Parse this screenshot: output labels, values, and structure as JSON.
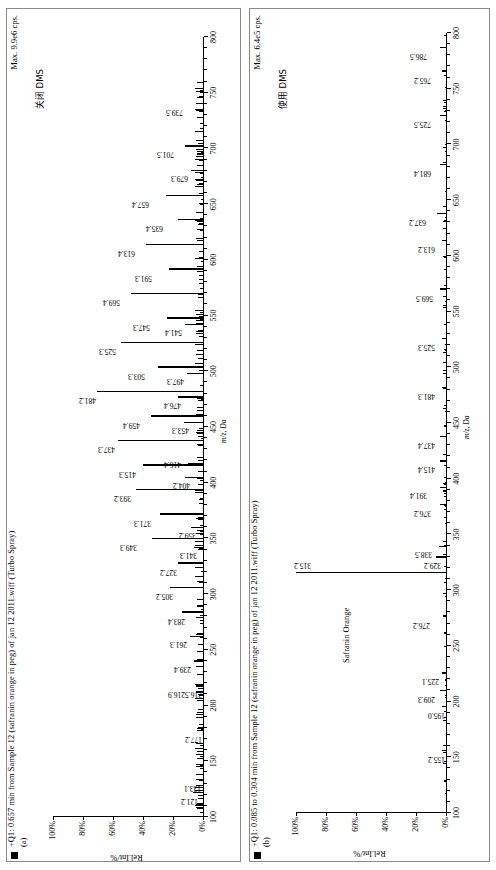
{
  "figure": {
    "domain": "mass-spectrum",
    "panels": [
      {
        "tag": "(a)",
        "title": "+Q1: 0.657 min from Sample 12 (safranin orange in peg) of jan 12 2011.wiff (Turbo Spray)",
        "max_label": "Max. 9.9e6 cps.",
        "condition_label": "关闭 DMS",
        "annotation": "",
        "ylabel": "Rel.Int/%",
        "xlabel": "m/z, Da",
        "ytick_labels": [
          "100%",
          "80%",
          "60%",
          "40%",
          "20%",
          "0%"
        ],
        "ytick_values": [
          100,
          80,
          60,
          40,
          20,
          0
        ],
        "xtick_labels": [
          "100",
          "150",
          "200",
          "250",
          "300",
          "350",
          "400",
          "450",
          "500",
          "550",
          "600",
          "650",
          "700",
          "750",
          "800"
        ],
        "xtick_values": [
          100,
          150,
          200,
          250,
          300,
          350,
          400,
          450,
          500,
          550,
          600,
          650,
          700,
          750,
          800
        ]
      },
      {
        "tag": "(b)",
        "title": "+Q1: 0.085 to 0.304 min from Sample 12 (safranin orange in peg) of jan 12 2011.wiff (Turbo Spray)",
        "max_label": "Max. 6.4e5 cps.",
        "condition_label": "使用 DMS",
        "annotation": "Safranin Orange",
        "ylabel": "Rel.Int/%",
        "xlabel": "m/z, Da",
        "ytick_labels": [
          "100%",
          "80%",
          "60%",
          "40%",
          "20%",
          "0%"
        ],
        "ytick_values": [
          100,
          80,
          60,
          40,
          20,
          0
        ],
        "xtick_labels": [
          "100",
          "150",
          "200",
          "250",
          "300",
          "350",
          "400",
          "450",
          "500",
          "550",
          "600",
          "650",
          "700",
          "750",
          "800"
        ],
        "xtick_values": [
          100,
          150,
          200,
          250,
          300,
          350,
          400,
          450,
          500,
          550,
          600,
          650,
          700,
          750,
          800
        ]
      }
    ]
  },
  "chart_data": [
    {
      "type": "line",
      "subtype": "mass-spectrum-stick",
      "title": "+Q1: 0.657 min from Sample 12 (safranin orange in peg) of jan 12 2011.wiff (Turbo Spray)",
      "panel": "(a)",
      "note": "关闭 DMS / Max. 9.9e6 cps.",
      "xlabel": "m/z, Da",
      "ylabel": "Rel.Int/%",
      "xlim": [
        100,
        800
      ],
      "ylim": [
        0,
        100
      ],
      "grid": false,
      "legend": "none",
      "x": [
        121.2,
        133.1,
        177.2,
        195.1,
        216.5,
        216.9,
        239.4,
        261.3,
        283.4,
        305.2,
        327.2,
        341.3,
        349.3,
        359.2,
        371.3,
        393.2,
        404.2,
        415.3,
        416.4,
        437.3,
        453.3,
        459.4,
        476.4,
        481.2,
        497.3,
        503.3,
        525.3,
        541.4,
        547.3,
        569.4,
        591.3,
        613.4,
        613.4,
        635.4,
        657.4,
        679.3,
        701.5,
        739.5
      ],
      "y": [
        7,
        5,
        4,
        4,
        3,
        5,
        6,
        9,
        14,
        22,
        17,
        6,
        34,
        8,
        29,
        45,
        12,
        40,
        10,
        57,
        13,
        35,
        17,
        71,
        11,
        30,
        55,
        12,
        24,
        48,
        23,
        38,
        38,
        17,
        25,
        8,
        12,
        5
      ],
      "labeled_peaks": [
        {
          "mz": "121.2",
          "rel_int": 7
        },
        {
          "mz": "133.1",
          "rel_int": 5
        },
        {
          "mz": "177.2",
          "rel_int": 4
        },
        {
          "mz": "216.5",
          "rel_int": 3
        },
        {
          "mz": "216.9",
          "rel_int": 5
        },
        {
          "mz": "239.4",
          "rel_int": 6
        },
        {
          "mz": "261.3",
          "rel_int": 9
        },
        {
          "mz": "283.4",
          "rel_int": 14
        },
        {
          "mz": "305.2",
          "rel_int": 22
        },
        {
          "mz": "327.2",
          "rel_int": 17
        },
        {
          "mz": "341.3",
          "rel_int": 6
        },
        {
          "mz": "349.3",
          "rel_int": 34
        },
        {
          "mz": "359.2",
          "rel_int": 8
        },
        {
          "mz": "371.3",
          "rel_int": 29
        },
        {
          "mz": "393.2",
          "rel_int": 45
        },
        {
          "mz": "404.2",
          "rel_int": 12
        },
        {
          "mz": "415.3",
          "rel_int": 40
        },
        {
          "mz": "416.4",
          "rel_int": 10
        },
        {
          "mz": "437.3",
          "rel_int": 57
        },
        {
          "mz": "453.3",
          "rel_int": 13
        },
        {
          "mz": "459.4",
          "rel_int": 35
        },
        {
          "mz": "476.4",
          "rel_int": 17
        },
        {
          "mz": "481.2",
          "rel_int": 71
        },
        {
          "mz": "497.3",
          "rel_int": 11
        },
        {
          "mz": "503.3",
          "rel_int": 30
        },
        {
          "mz": "525.3",
          "rel_int": 55
        },
        {
          "mz": "541.4",
          "rel_int": 12
        },
        {
          "mz": "547.3",
          "rel_int": 24
        },
        {
          "mz": "569.4",
          "rel_int": 48
        },
        {
          "mz": "591.3",
          "rel_int": 23
        },
        {
          "mz": "613.4",
          "rel_int": 38
        },
        {
          "mz": "635.4",
          "rel_int": 17
        },
        {
          "mz": "657.4",
          "rel_int": 25
        },
        {
          "mz": "679.3",
          "rel_int": 8
        },
        {
          "mz": "701.5",
          "rel_int": 12
        },
        {
          "mz": "739.5",
          "rel_int": 5
        }
      ]
    },
    {
      "type": "line",
      "subtype": "mass-spectrum-stick",
      "title": "+Q1: 0.085 to 0.304 min from Sample 12 (safranin orange in peg) of jan 12 2011.wiff (Turbo Spray)",
      "panel": "(b)",
      "note": "使用 DMS / Max. 6.4e5 cps.",
      "xlabel": "m/z, Da",
      "ylabel": "Rel.Int/%",
      "xlim": [
        100,
        800
      ],
      "ylim": [
        0,
        100
      ],
      "grid": false,
      "legend": "none",
      "annotation": "Safranin Orange",
      "x": [
        155.2,
        195.0,
        209.3,
        225.1,
        276.2,
        315.2,
        329.2,
        338.5,
        376.2,
        391.4,
        415.4,
        437.4,
        481.3,
        525.3,
        569.5,
        613.2,
        637.2,
        681.4,
        725.5,
        765.2,
        786.5
      ],
      "y": [
        3,
        3,
        4,
        3,
        2,
        100,
        7,
        5,
        4,
        4,
        4,
        4,
        3,
        3,
        4,
        3,
        6,
        4,
        4,
        3,
        4
      ],
      "labeled_peaks": [
        {
          "mz": "155.2",
          "rel_int": 3
        },
        {
          "mz": "195.0",
          "rel_int": 3
        },
        {
          "mz": "209.3",
          "rel_int": 4
        },
        {
          "mz": "225.1",
          "rel_int": 3
        },
        {
          "mz": "276.2",
          "rel_int": 2
        },
        {
          "mz": "315.2",
          "rel_int": 100
        },
        {
          "mz": "329.2",
          "rel_int": 7
        },
        {
          "mz": "338.5",
          "rel_int": 5
        },
        {
          "mz": "376.2",
          "rel_int": 4
        },
        {
          "mz": "391.4",
          "rel_int": 4
        },
        {
          "mz": "415.4",
          "rel_int": 4
        },
        {
          "mz": "437.4",
          "rel_int": 4
        },
        {
          "mz": "481.3",
          "rel_int": 3
        },
        {
          "mz": "525.3",
          "rel_int": 3
        },
        {
          "mz": "569.5",
          "rel_int": 4
        },
        {
          "mz": "613.2",
          "rel_int": 3
        },
        {
          "mz": "637.2",
          "rel_int": 6
        },
        {
          "mz": "681.4",
          "rel_int": 4
        },
        {
          "mz": "725.5",
          "rel_int": 4
        },
        {
          "mz": "765.2",
          "rel_int": 3
        },
        {
          "mz": "786.5",
          "rel_int": 4
        }
      ]
    }
  ]
}
